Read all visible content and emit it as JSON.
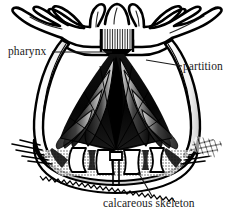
{
  "figure": {
    "style": "black-and-white engraving",
    "background_color": "#ffffff",
    "ink_color": "#000000",
    "text_color": "#1a1a1a"
  },
  "labels": {
    "pharynx": "pharynx",
    "partition": "partition",
    "calcareous_skeleton": "calcareous skeleton"
  },
  "leader_lines": [
    {
      "name": "pharynx-leader",
      "from_label": "pharynx",
      "x1": 52,
      "y1": 52,
      "x2": 112,
      "y2": 52
    },
    {
      "name": "partition-leader",
      "from_label": "partition",
      "x1": 182,
      "y1": 66,
      "x2": 146,
      "y2": 60
    },
    {
      "name": "calcareous-skeleton-leader",
      "from_label": "calcareous skeleton",
      "x1": 152,
      "y1": 196,
      "x2": 138,
      "y2": 172
    }
  ],
  "anatomy_parts": [
    {
      "name": "tentacle-crown",
      "description": "Ring of lobed tentacles radiating from the top of the polyp"
    },
    {
      "name": "pharynx",
      "description": "Striated central tube at the oral opening leading into the gastrovascular cavity"
    },
    {
      "name": "partition",
      "description": "Radial mesenterial septa dividing the body cavity"
    },
    {
      "name": "body-wall",
      "description": "Outer column wall of the polyp"
    },
    {
      "name": "calcareous-skeleton",
      "description": "Hard calcium carbonate cup forming the base of the polyp"
    }
  ]
}
